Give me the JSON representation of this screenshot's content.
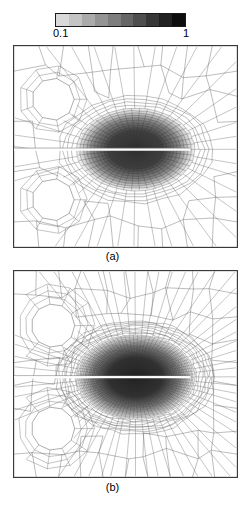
{
  "figure": {
    "type": "finite-element-mesh-figure",
    "background": "#ffffff",
    "width": 252,
    "height": 514
  },
  "colorbar": {
    "name": "grayscale-colorbar",
    "orientation": "horizontal",
    "min_label": "0.1",
    "max_label": "1",
    "min_value": 0.1,
    "max_value": 1,
    "segment_count": 10,
    "segments": [
      "#d9d9d9",
      "#c4c4c4",
      "#ababab",
      "#949494",
      "#7d7d7d",
      "#666666",
      "#4f4f4f",
      "#383838",
      "#212121",
      "#0d0d0d"
    ],
    "border_color": "#1a1a1a"
  },
  "panels": [
    {
      "id": "a",
      "caption": "(a)",
      "description": "coarse adaptive quadrilateral mesh with two circular holes and refined elliptical damage zone around a horizontal crack",
      "mesh_density": "coarse",
      "frame_color": "#3a3a3a",
      "mesh_line_color": "#5a5a5a",
      "damage_zone_color": "#2b2b2b",
      "crack_color": "#ffffff",
      "hole_count": 2
    },
    {
      "id": "b",
      "caption": "(b)",
      "description": "fine adaptive quadrilateral mesh with two circular holes and highly refined elliptical damage zone around a horizontal crack",
      "mesh_density": "fine",
      "frame_color": "#3a3a3a",
      "mesh_line_color": "#5a5a5a",
      "damage_zone_color": "#1f1f1f",
      "crack_color": "#ffffff",
      "hole_count": 2
    }
  ],
  "chart_data": {
    "type": "heatmap",
    "title": "",
    "xlabel": "",
    "ylabel": "",
    "colorbar_label": "",
    "colormap": "grayscale-inverted",
    "colorbar_ticks": [
      "0.1",
      "1"
    ],
    "colorbar_tick_values": [
      0.1,
      1
    ],
    "legend_position": "top",
    "grid": false,
    "panels": [
      "(a)",
      "(b)"
    ],
    "series": [
      {
        "name": "(a)",
        "values": [
          0.1,
          1
        ]
      },
      {
        "name": "(b)",
        "values": [
          0.1,
          1
        ]
      }
    ]
  }
}
